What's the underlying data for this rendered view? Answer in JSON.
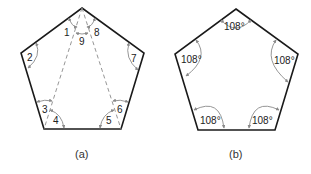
{
  "figure_a": {
    "caption": "(a)",
    "angle_labels": [
      "1",
      "2",
      "3",
      "4",
      "5",
      "6",
      "7",
      "8",
      "9"
    ],
    "description": "Regular pentagon divided into three triangles by two dashed diagonals from the top vertex; nine angles numbered"
  },
  "figure_b": {
    "caption": "(b)",
    "angle_labels": [
      "108°",
      "108°",
      "108°",
      "108°",
      "108°"
    ],
    "description": "Regular pentagon with each interior angle marked 108°"
  },
  "colors": {
    "edge": "#1a1a1a",
    "annotation": "#8a8a8a",
    "background": "#ffffff"
  }
}
